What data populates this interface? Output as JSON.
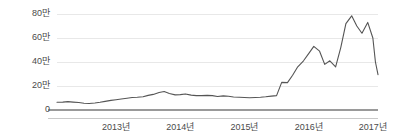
{
  "chart_data": {
    "type": "line",
    "title": "",
    "subtitle": "",
    "xlabel": "",
    "ylabel": "",
    "unit_label": "만",
    "legend": [],
    "legend_position": "none",
    "grid": true,
    "grid_axis": "y",
    "line_color": "#555555",
    "axis_color": "#9a9a9a",
    "grid_color": "#e8e8e8",
    "text_color": "#4a4a4a",
    "background": "#ffffff",
    "xlim": [
      2012.08,
      2017.08
    ],
    "ylim": [
      0,
      85
    ],
    "y_ticks": [
      0,
      20,
      40,
      60,
      80
    ],
    "y_tick_labels": [
      "0",
      "20만",
      "40만",
      "60만",
      "80만"
    ],
    "x_ticks": [
      2013,
      2014,
      2015,
      2016,
      2017
    ],
    "x_tick_labels": [
      "2013년",
      "2014년",
      "2015년",
      "2016년",
      "2017년"
    ],
    "series": [
      {
        "name": "가격",
        "color": "#555555",
        "x": [
          2012.08,
          2012.17,
          2012.25,
          2012.33,
          2012.42,
          2012.5,
          2012.58,
          2012.67,
          2012.75,
          2012.83,
          2012.92,
          2013.0,
          2013.08,
          2013.17,
          2013.25,
          2013.33,
          2013.42,
          2013.5,
          2013.58,
          2013.67,
          2013.75,
          2013.83,
          2013.92,
          2014.0,
          2014.08,
          2014.17,
          2014.25,
          2014.33,
          2014.42,
          2014.5,
          2014.58,
          2014.67,
          2014.75,
          2014.83,
          2014.92,
          2015.0,
          2015.08,
          2015.17,
          2015.25,
          2015.33,
          2015.42,
          2015.5,
          2015.58,
          2015.67,
          2015.75,
          2015.83,
          2015.92,
          2016.0,
          2016.08,
          2016.17,
          2016.25,
          2016.33,
          2016.42,
          2016.5,
          2016.58,
          2016.67,
          2016.75,
          2016.83,
          2016.92,
          2017.0,
          2017.04,
          2017.08
        ],
        "y": [
          6.5,
          6.6,
          7.0,
          6.6,
          6.2,
          5.6,
          5.4,
          5.8,
          6.4,
          7.2,
          8.0,
          8.6,
          9.2,
          9.8,
          10.4,
          10.6,
          11.0,
          12.2,
          13.0,
          14.6,
          15.4,
          13.8,
          12.6,
          12.8,
          13.4,
          12.4,
          12.0,
          12.0,
          12.2,
          12.0,
          11.2,
          11.8,
          11.4,
          10.8,
          10.6,
          10.4,
          10.2,
          10.4,
          10.6,
          11.0,
          11.6,
          12.0,
          23.0,
          22.8,
          29.0,
          36.0,
          41.0,
          47.0,
          53.0,
          49.0,
          38.0,
          41.0,
          36.0,
          52.0,
          72.0,
          78.5,
          70.0,
          64.0,
          73.0,
          60.0,
          40.0,
          29.5
        ]
      }
    ]
  },
  "axes": {
    "y_label_positions_px": [
      16,
      38,
      60,
      82,
      110
    ],
    "x_label_positions_px": [
      120,
      183,
      246,
      309,
      372
    ],
    "plot_left_px": 57,
    "plot_right_px": 378,
    "plot_top_px": 8,
    "plot_bottom_px": 110
  }
}
